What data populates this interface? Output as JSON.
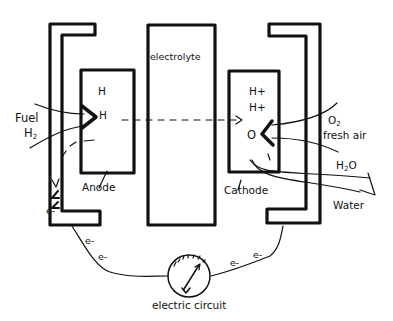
{
  "diagram": {
    "type": "fuel-cell schematic (hand-drawn)",
    "components": {
      "anode": {
        "label": "Anode",
        "inner_labels": [
          "H",
          "H"
        ]
      },
      "electrolyte": {
        "label": "electrolyte"
      },
      "cathode": {
        "label": "Cathode",
        "inner_labels": [
          "H+",
          "H+",
          "O"
        ]
      },
      "circuit": {
        "label": "electric circuit",
        "electron_labels": [
          "e-",
          "e-",
          "e-",
          "e-",
          "e-"
        ]
      }
    },
    "inputs": {
      "fuel": {
        "label": "Fuel",
        "formula_main": "H",
        "formula_sub": "2"
      },
      "air": {
        "formula_main": "O",
        "formula_sub": "2",
        "label": "fresh air"
      }
    },
    "outputs": {
      "water": {
        "formula_main": "H",
        "formula_sub": "2",
        "formula_tail": "O",
        "label": "Water"
      }
    },
    "flows": [
      {
        "from": "anode",
        "to": "cathode",
        "style": "dashed-arrow",
        "meaning": "proton transfer"
      },
      {
        "from": "anode",
        "to": "circuit",
        "style": "wire",
        "carrier": "e-"
      },
      {
        "from": "circuit",
        "to": "cathode",
        "style": "wire",
        "carrier": "e-"
      }
    ],
    "colors": {
      "ink": "#111111",
      "background": "#ffffff"
    }
  }
}
